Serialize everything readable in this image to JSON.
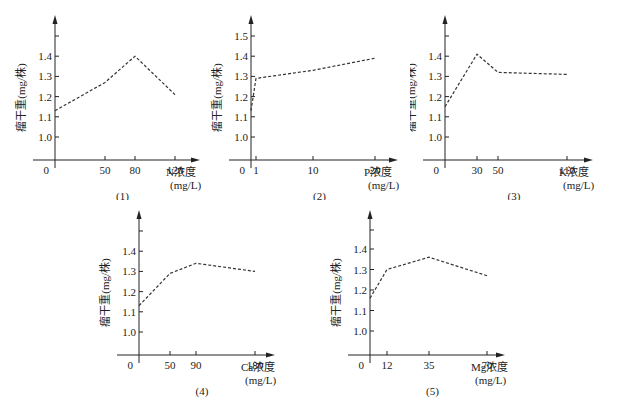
{
  "figure": {
    "ylabel": "瘤干重(mg/株)",
    "xunit": "(mg/L)",
    "colors": {
      "axis": "#222222",
      "line": "#333333"
    }
  },
  "chart_data": [
    {
      "type": "line",
      "caption": "(1)",
      "xlabel": "N浓度",
      "xunit": "(mg/L)",
      "ylabel": "瘤干重(mg/株)",
      "x_ticks": [
        0,
        50,
        80,
        120
      ],
      "y_ticks": [
        1.0,
        1.1,
        1.2,
        1.3,
        1.4
      ],
      "ylim": [
        0.9,
        1.5
      ],
      "x": [
        0,
        50,
        80,
        120
      ],
      "y": [
        1.13,
        1.27,
        1.4,
        1.21
      ],
      "line_style": "dashed"
    },
    {
      "type": "line",
      "caption": "(2)",
      "xlabel": "P浓度",
      "xunit": "(mg/L)",
      "ylabel": "瘤干重(mg/株)",
      "x_ticks": [
        0,
        1,
        10,
        20
      ],
      "y_ticks": [
        1.0,
        1.1,
        1.2,
        1.3,
        1.4,
        1.5
      ],
      "ylim": [
        0.9,
        1.6
      ],
      "x": [
        0,
        1,
        10,
        20
      ],
      "y": [
        1.13,
        1.29,
        1.33,
        1.39
      ],
      "line_style": "dashed"
    },
    {
      "type": "line",
      "caption": "(3)",
      "xlabel": "K浓度",
      "xunit": "(mg/L)",
      "ylabel": "瘤干重(mg/株)",
      "x_ticks": [
        0,
        30,
        50,
        110
      ],
      "y_ticks": [
        1.0,
        1.1,
        1.2,
        1.3,
        1.4
      ],
      "ylim": [
        0.9,
        1.5
      ],
      "x": [
        0,
        30,
        50,
        110
      ],
      "y": [
        1.15,
        1.41,
        1.32,
        1.31
      ],
      "line_style": "dashed"
    },
    {
      "type": "line",
      "caption": "(4)",
      "xlabel": "Ca浓度",
      "xunit": "(mg/L)",
      "ylabel": "瘤干重(mg/株)",
      "x_ticks": [
        0,
        50,
        90,
        180
      ],
      "y_ticks": [
        1.0,
        1.1,
        1.2,
        1.3,
        1.4
      ],
      "ylim": [
        0.9,
        1.5
      ],
      "x": [
        0,
        50,
        90,
        180
      ],
      "y": [
        1.13,
        1.29,
        1.34,
        1.3
      ],
      "line_style": "dashed"
    },
    {
      "type": "line",
      "caption": "(5)",
      "xlabel": "Mg浓度",
      "xunit": "(mg/L)",
      "ylabel": "瘤干重(mg/株)",
      "x_ticks": [
        0,
        12,
        35,
        70
      ],
      "y_ticks": [
        1.0,
        1.1,
        1.2,
        1.3,
        1.4
      ],
      "ylim": [
        0.9,
        1.5
      ],
      "x": [
        0,
        12,
        35,
        70
      ],
      "y": [
        1.16,
        1.3,
        1.36,
        1.27
      ],
      "line_style": "dashed"
    }
  ]
}
